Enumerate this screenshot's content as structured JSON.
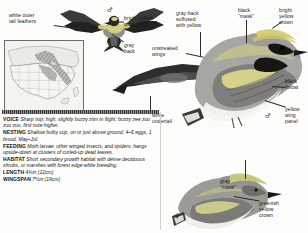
{
  "labels": {
    "white_outer_tail": "white outer\ntail feathers",
    "bright_yellow_wing_panel": "bright yellow\nwing panel",
    "gray_back": "gray\nback",
    "gray_back_suffused": "gray back\nsuffused\nwith yellow",
    "unstreaked_wings": "unstreaked\nwings",
    "black_mask": "black\n“mask”",
    "bright_yellow_crown": "bright\nyellow\ncrown",
    "black_throat": "black\nthroat",
    "yellow_wing_panel": "yellow\nwing\npanel",
    "white_undertail": "white\nundertail",
    "gray_mask": "gray\n“mask”",
    "greenish_yellow_crown": "greenish\nyellow\ncrown"
  },
  "symbols": {
    "male": "♂",
    "female": "♀"
  },
  "facts": [
    {
      "key": "VOICE",
      "value": "Sharp tsip; high, slightly buzzy ziim in flight; buzzy zee zuu zuu zuu, first note higher."
    },
    {
      "key": "NESTING",
      "value": "Shallow bulky cup, on or just above ground; 4–6 eggs, 1 brood, May–Jul."
    },
    {
      "key": "FEEDING",
      "value": "Moth larvae, other winged insects, and spiders; hangs upside-down at clusters of curled-up dead leaves."
    },
    {
      "key": "HABITAT",
      "value": "Short secondary growth habitat with dense deciduous shrubs, or marshes with forest edge while breeding."
    },
    {
      "key": "LENGTH",
      "value": "4¾in (12cm)"
    },
    {
      "key": "WINGSPAN",
      "value": "7½in (19cm)"
    }
  ],
  "colors": {
    "text": "#161616",
    "leader": "#2b2b2b",
    "map_land": "#f2f1ee",
    "map_range": "#8a8a8a",
    "plumage_dark": "#1c1c1c",
    "plumage_gray": "#9b9b99",
    "plumage_pale": "#efeeea"
  }
}
